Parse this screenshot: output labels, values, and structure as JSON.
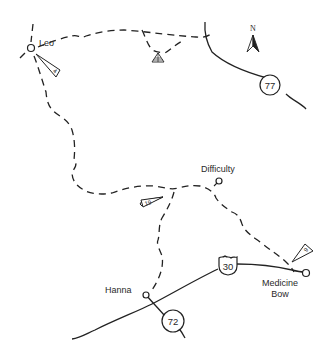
{
  "map": {
    "compass": {
      "label": "N"
    },
    "towns": [
      {
        "name": "Leo"
      },
      {
        "name": "Difficulty"
      },
      {
        "name": "Hanna"
      },
      {
        "name": "Medicine Bow",
        "lines": [
          "Medicine",
          "Bow"
        ]
      }
    ],
    "highways": [
      {
        "number": "77",
        "type": "state"
      },
      {
        "number": "30",
        "type": "us"
      },
      {
        "number": "72",
        "type": "state"
      }
    ],
    "route_markers": [
      {
        "number": "4",
        "near": "Leo"
      },
      {
        "number": "19",
        "near": "Difficulty junction"
      },
      {
        "number": "9",
        "near": "Medicine Bow"
      }
    ],
    "features": [
      {
        "type": "campground",
        "symbol": "tent-triangle"
      }
    ]
  }
}
